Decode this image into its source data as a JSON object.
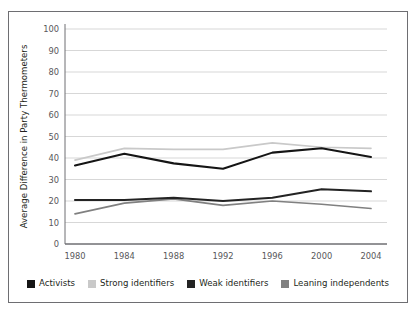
{
  "chart_data": {
    "type": "line",
    "title": "",
    "xlabel": "",
    "ylabel": "Average Difference in Party Thermometers",
    "categories": [
      1980,
      1984,
      1988,
      1992,
      1996,
      2000,
      2004
    ],
    "x_tick_labels": [
      "1980",
      "1984",
      "1988",
      "1992",
      "1996",
      "2000",
      "2004"
    ],
    "y_tick_labels": [
      "0",
      "10",
      "20",
      "30",
      "40",
      "50",
      "60",
      "70",
      "80",
      "90",
      "100"
    ],
    "y_ticks": [
      0,
      10,
      20,
      30,
      40,
      50,
      60,
      70,
      80,
      90,
      100
    ],
    "ylim": [
      0,
      100
    ],
    "grid": true,
    "grid_axis": "y",
    "legend_position": "bottom",
    "series": [
      {
        "name": "Activists",
        "color": "#151515",
        "values": [
          36.5,
          42.0,
          37.5,
          35.0,
          42.5,
          44.5,
          40.5
        ]
      },
      {
        "name": "Strong identifiers",
        "color": "#c9c9c9",
        "values": [
          39.0,
          44.5,
          44.0,
          44.0,
          47.0,
          45.0,
          44.5
        ]
      },
      {
        "name": "Weak identifiers",
        "color": "#232323",
        "values": [
          20.5,
          20.5,
          21.5,
          20.0,
          21.5,
          25.5,
          24.5
        ]
      },
      {
        "name": "Leaning independents",
        "color": "#808080",
        "values": [
          14.0,
          19.0,
          21.0,
          18.0,
          20.0,
          18.5,
          16.5
        ]
      }
    ]
  },
  "legend": {
    "items": [
      {
        "label": "Activists",
        "color": "#151515"
      },
      {
        "label": "Strong identifiers",
        "color": "#c9c9c9"
      },
      {
        "label": "Weak identifiers",
        "color": "#232323"
      },
      {
        "label": "Leaning independents",
        "color": "#808080"
      }
    ]
  },
  "axes": {
    "y_axis_title": "Average Difference in Party Thermometers"
  },
  "colors": {
    "frame_border": "#6e6e72",
    "axis_line": "#6e6e72",
    "grid_line": "#d7d7d7",
    "tick_text": "#58585b",
    "background": "#ffffff"
  }
}
